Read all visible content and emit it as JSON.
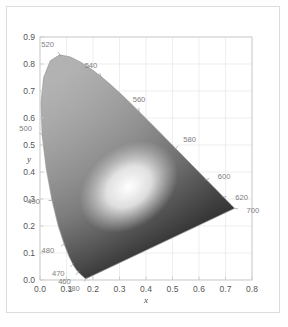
{
  "figure": {
    "background": "#ffffff",
    "border_color": "#dcdcdc",
    "frame_color": "#c9c9c9",
    "grid_color": "#e6e6e6",
    "locus_color": "#9a9a9a"
  },
  "chart_data": {
    "type": "scatter",
    "title": "",
    "subtitle": "",
    "xlabel": "x",
    "ylabel": "y",
    "xlim": [
      0.0,
      0.8
    ],
    "ylim": [
      0.0,
      0.9
    ],
    "grid": true,
    "legend_position": "none",
    "xticks": [
      "0.0",
      "0.1",
      "0.2",
      "0.3",
      "0.4",
      "0.5",
      "0.6",
      "0.7",
      "0.8"
    ],
    "xtick_values": [
      0.0,
      0.1,
      0.2,
      0.3,
      0.4,
      0.5,
      0.6,
      0.7,
      0.8
    ],
    "yticks": [
      "0.0",
      "0.1",
      "0.2",
      "0.3",
      "0.4",
      "0.5",
      "0.6",
      "0.7",
      "0.8",
      "0.9"
    ],
    "ytick_values": [
      0.0,
      0.1,
      0.2,
      0.3,
      0.4,
      0.5,
      0.6,
      0.7,
      0.8,
      0.9
    ],
    "annotations": [
      {
        "label": "380",
        "x": 0.1741,
        "y": 0.005
      },
      {
        "label": "460",
        "x": 0.144,
        "y": 0.0297
      },
      {
        "label": "470",
        "x": 0.1241,
        "y": 0.0578
      },
      {
        "label": "480",
        "x": 0.0913,
        "y": 0.1327
      },
      {
        "label": "490",
        "x": 0.0454,
        "y": 0.295
      },
      {
        "label": "500",
        "x": 0.0082,
        "y": 0.5384
      },
      {
        "label": "520",
        "x": 0.0743,
        "y": 0.8338
      },
      {
        "label": "540",
        "x": 0.2296,
        "y": 0.7543
      },
      {
        "label": "560",
        "x": 0.3731,
        "y": 0.6245
      },
      {
        "label": "580",
        "x": 0.5125,
        "y": 0.4866
      },
      {
        "label": "600",
        "x": 0.627,
        "y": 0.3725
      },
      {
        "label": "620",
        "x": 0.6915,
        "y": 0.3083
      },
      {
        "label": "700",
        "x": 0.7347,
        "y": 0.2653
      }
    ],
    "locus_points": [
      [
        0.1741,
        0.005
      ],
      [
        0.174,
        0.005
      ],
      [
        0.1738,
        0.0049
      ],
      [
        0.1736,
        0.0049
      ],
      [
        0.1733,
        0.0048
      ],
      [
        0.173,
        0.0048
      ],
      [
        0.1726,
        0.0048
      ],
      [
        0.1721,
        0.0048
      ],
      [
        0.1714,
        0.0051
      ],
      [
        0.1703,
        0.0058
      ],
      [
        0.1689,
        0.0069
      ],
      [
        0.1669,
        0.0086
      ],
      [
        0.1644,
        0.0109
      ],
      [
        0.1611,
        0.0138
      ],
      [
        0.1566,
        0.0177
      ],
      [
        0.151,
        0.0227
      ],
      [
        0.144,
        0.0297
      ],
      [
        0.1355,
        0.0399
      ],
      [
        0.1241,
        0.0578
      ],
      [
        0.1096,
        0.0868
      ],
      [
        0.0913,
        0.1327
      ],
      [
        0.0687,
        0.2007
      ],
      [
        0.0454,
        0.295
      ],
      [
        0.0235,
        0.4127
      ],
      [
        0.0082,
        0.5384
      ],
      [
        0.0039,
        0.6548
      ],
      [
        0.0139,
        0.7502
      ],
      [
        0.0389,
        0.812
      ],
      [
        0.0743,
        0.8338
      ],
      [
        0.1142,
        0.8262
      ],
      [
        0.1547,
        0.8059
      ],
      [
        0.1929,
        0.7816
      ],
      [
        0.2296,
        0.7543
      ],
      [
        0.2658,
        0.7243
      ],
      [
        0.3016,
        0.6923
      ],
      [
        0.3373,
        0.6589
      ],
      [
        0.3731,
        0.6245
      ],
      [
        0.4087,
        0.5896
      ],
      [
        0.4441,
        0.5547
      ],
      [
        0.4788,
        0.5202
      ],
      [
        0.5125,
        0.4866
      ],
      [
        0.5448,
        0.4544
      ],
      [
        0.5752,
        0.4242
      ],
      [
        0.6029,
        0.3965
      ],
      [
        0.627,
        0.3725
      ],
      [
        0.6482,
        0.3514
      ],
      [
        0.6658,
        0.334
      ],
      [
        0.6801,
        0.3197
      ],
      [
        0.6915,
        0.3083
      ],
      [
        0.7006,
        0.2993
      ],
      [
        0.7079,
        0.292
      ],
      [
        0.714,
        0.2859
      ],
      [
        0.719,
        0.2809
      ],
      [
        0.723,
        0.277
      ],
      [
        0.726,
        0.274
      ],
      [
        0.7283,
        0.2717
      ],
      [
        0.73,
        0.27
      ],
      [
        0.7311,
        0.2689
      ],
      [
        0.732,
        0.268
      ],
      [
        0.7327,
        0.2673
      ],
      [
        0.7334,
        0.2666
      ],
      [
        0.734,
        0.266
      ],
      [
        0.7344,
        0.2656
      ],
      [
        0.7346,
        0.2654
      ],
      [
        0.7347,
        0.2653
      ]
    ]
  }
}
